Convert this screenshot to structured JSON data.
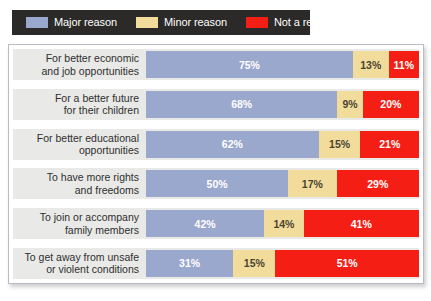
{
  "legend": {
    "items": [
      {
        "label": "Major reason",
        "color": "#9ba8ce",
        "key": "major"
      },
      {
        "label": "Minor reason",
        "color": "#f2dc9b",
        "key": "minor"
      },
      {
        "label": "Not a reason",
        "color": "#f41e14",
        "key": "not"
      }
    ]
  },
  "chart_data": {
    "type": "bar",
    "orientation": "horizontal",
    "stacked": true,
    "unit": "%",
    "title": "",
    "xlabel": "",
    "ylabel": "",
    "xlim": [
      0,
      100
    ],
    "grid": false,
    "legend_position": "top-left",
    "categories": [
      "For better economic and job opportunities",
      "For a better future for their children",
      "For better educational opportunities",
      "To have more rights and freedoms",
      "To join or accompany family members",
      "To get away from unsafe or violent conditions"
    ],
    "category_lines": [
      [
        "For better economic",
        "and job opportunities"
      ],
      [
        "For a better future",
        "for their children"
      ],
      [
        "For better educational",
        "opportunities"
      ],
      [
        "To have more rights",
        "and freedoms"
      ],
      [
        "To join or accompany",
        "family members"
      ],
      [
        "To get away from unsafe",
        "or violent conditions"
      ]
    ],
    "series": [
      {
        "name": "Major reason",
        "color": "#9ba8ce",
        "values": [
          75,
          68,
          62,
          50,
          42,
          31
        ]
      },
      {
        "name": "Minor reason",
        "color": "#f2dc9b",
        "values": [
          13,
          9,
          15,
          17,
          14,
          15
        ]
      },
      {
        "name": "Not a reason",
        "color": "#f41e14",
        "values": [
          11,
          20,
          21,
          29,
          41,
          51
        ]
      }
    ],
    "labels": {
      "major": [
        "75%",
        "68%",
        "62%",
        "50%",
        "42%",
        "31%"
      ],
      "minor": [
        "13%",
        "9%",
        "15%",
        "17%",
        "14%",
        "15%"
      ],
      "not": [
        "11%",
        "20%",
        "21%",
        "29%",
        "41%",
        "51%"
      ]
    }
  }
}
